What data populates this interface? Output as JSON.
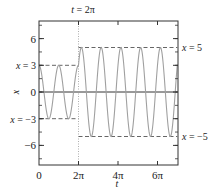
{
  "chart_data": {
    "type": "line",
    "title": "",
    "xlabel": "t",
    "ylabel": "x",
    "xlim": [
      0,
      22
    ],
    "ylim": [
      -8.2,
      8
    ],
    "grid": false,
    "legend": null,
    "x_ticks": [
      {
        "value": 0,
        "label": "0"
      },
      {
        "value": 6.2832,
        "label": "2π"
      },
      {
        "value": 12.5664,
        "label": "4π"
      },
      {
        "value": 18.8496,
        "label": "6π"
      }
    ],
    "y_ticks": [
      {
        "value": 6,
        "label": "6"
      },
      {
        "value": 3,
        "label": "x = 3"
      },
      {
        "value": 0,
        "label": "0"
      },
      {
        "value": -3,
        "label": "x = −3"
      },
      {
        "value": -6,
        "label": "−6"
      }
    ],
    "y_minor_tick_step": 1.5,
    "series": [
      {
        "name": "x(t)",
        "color": "#a0a0a0",
        "description": "x = 3cos(2t) for t < 2π; x = 3cos(2t) + 4sin(2t) for t ≥ 2π",
        "pieces": [
          {
            "t_start": 0,
            "t_end": 6.2832,
            "a": 3,
            "b": 0,
            "omega": 2
          },
          {
            "t_start": 6.2832,
            "t_end": 22,
            "a": 3,
            "b": 4,
            "omega": 2
          }
        ]
      }
    ],
    "reference_lines": [
      {
        "type": "hline",
        "y": 3,
        "x_from": 0,
        "x_to": 6.2832,
        "style": "dashed",
        "label": ""
      },
      {
        "type": "hline",
        "y": -3,
        "x_from": 0,
        "x_to": 6.2832,
        "style": "dashed",
        "label": ""
      },
      {
        "type": "hline",
        "y": 5,
        "x_from": 6.2832,
        "x_to": 22,
        "style": "dashed",
        "label": "x = 5"
      },
      {
        "type": "hline",
        "y": -5,
        "x_from": 6.2832,
        "x_to": 22,
        "style": "dashed",
        "label": "x = −5"
      },
      {
        "type": "hline",
        "y": 0,
        "x_from": 0,
        "x_to": 22,
        "style": "solid",
        "label": ""
      },
      {
        "type": "vline",
        "x": 6.2832,
        "style": "dotted",
        "label": "t = 2π"
      }
    ],
    "annotations": [
      "t = 2π",
      "x = 3",
      "x = −3",
      "x = 5",
      "x = −5"
    ]
  },
  "labels": {
    "top": "t = 2π",
    "right_upper": "x = 5",
    "right_lower": "x = −5",
    "xlabel": "t",
    "ylabel": "x"
  }
}
